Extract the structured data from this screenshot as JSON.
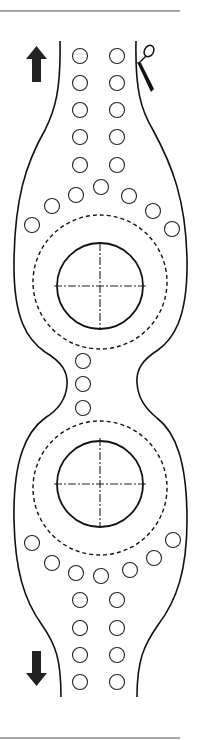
{
  "diagram": {
    "title": "",
    "colors": {
      "stroke": "#111111",
      "rule": "#555555",
      "arrow": "#222222",
      "background": "#ffffff"
    },
    "icons": {
      "top_arrow": "arrow-up-icon",
      "bottom_arrow": "arrow-down-icon",
      "cut_mark": "scissors-icon"
    },
    "holes": {
      "upper_columns": [
        [
          80,
          56
        ],
        [
          117,
          56
        ],
        [
          80,
          83
        ],
        [
          117,
          83
        ],
        [
          80,
          110
        ],
        [
          117,
          110
        ],
        [
          80,
          137
        ],
        [
          117,
          137
        ],
        [
          80,
          165
        ],
        [
          117,
          165
        ]
      ],
      "upper_arc": [
        [
          32,
          225
        ],
        [
          52,
          206
        ],
        [
          76,
          195
        ],
        [
          101,
          187
        ],
        [
          129,
          196
        ],
        [
          153,
          211
        ],
        [
          172,
          229
        ]
      ],
      "waist": [
        [
          83,
          361
        ],
        [
          83,
          384
        ],
        [
          83,
          408
        ]
      ],
      "lower_arc": [
        [
          32,
          543
        ],
        [
          52,
          563
        ],
        [
          76,
          573
        ],
        [
          101,
          576
        ],
        [
          130,
          570
        ],
        [
          154,
          558
        ],
        [
          173,
          540
        ]
      ],
      "lower_columns": [
        [
          80,
          600
        ],
        [
          117,
          600
        ],
        [
          80,
          628
        ],
        [
          117,
          628
        ],
        [
          80,
          655
        ],
        [
          117,
          655
        ],
        [
          80,
          682
        ],
        [
          117,
          682
        ]
      ]
    },
    "lenses": [
      {
        "cx": 100,
        "cy": 286,
        "r": 43,
        "dashed_r": 67
      },
      {
        "cx": 100,
        "cy": 484,
        "r": 43,
        "dashed_r": 67
      }
    ]
  }
}
